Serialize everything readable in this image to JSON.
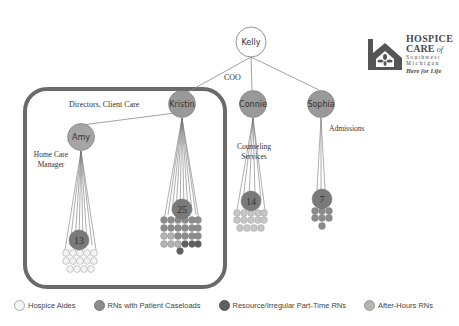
{
  "colors": {
    "aide": "#f4f4f4",
    "rn_caseload": "#8c8c8c",
    "resource_rn": "#5e5e5e",
    "after_hours_rn": "#b4b4b4",
    "leader": "#999999",
    "border": "#666666"
  },
  "logo": {
    "line1": "HOSPICE",
    "line2": "CARE",
    "line2_suffix": "of",
    "line3": "Southwest",
    "line4": "Michigan",
    "tagline": "Here for Life"
  },
  "nodes": {
    "kelly": "Kelly",
    "kristin": "Kristin",
    "connie": "Connie",
    "sophia": "Sophia",
    "amy": "Amy"
  },
  "role_labels": {
    "coo": "COO",
    "directors": "Directors, Client Care",
    "home_care_1": "Home Care",
    "home_care_2": "Manager",
    "counseling_1": "Counseling",
    "counseling_2": "Services",
    "admissions": "Admissions"
  },
  "team_counts": {
    "amy": "13",
    "kristin": "25",
    "connie": "14",
    "sophia": "7"
  },
  "legend": [
    {
      "label": "Hospice Aides",
      "key": "aide"
    },
    {
      "label": "RNs with Patient Caseloads",
      "key": "rn_caseload"
    },
    {
      "label": "Resource/Irregular Part-Time RNs",
      "key": "resource_rn"
    },
    {
      "label": "After-Hours RNs",
      "key": "after_hours_rn"
    }
  ]
}
